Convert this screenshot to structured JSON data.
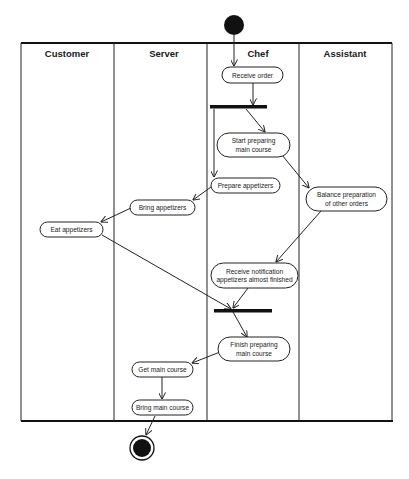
{
  "diagram": {
    "type": "uml-activity-diagram",
    "lanes": [
      {
        "id": "customer",
        "title": "Customer"
      },
      {
        "id": "server",
        "title": "Server"
      },
      {
        "id": "chef",
        "title": "Chef"
      },
      {
        "id": "assistant",
        "title": "Assistant"
      }
    ],
    "nodes": {
      "receive_order": {
        "lane": "chef",
        "lines": [
          "Receive order"
        ]
      },
      "start_main": {
        "lane": "chef",
        "lines": [
          "Start preparing",
          "main course"
        ]
      },
      "prepare_app": {
        "lane": "chef",
        "lines": [
          "Prepare appetizers"
        ]
      },
      "balance": {
        "lane": "assistant",
        "lines": [
          "Balance preparation",
          "of other orders"
        ]
      },
      "bring_app": {
        "lane": "server",
        "lines": [
          "Bring appetizers"
        ]
      },
      "eat_app": {
        "lane": "customer",
        "lines": [
          "Eat appetizers"
        ]
      },
      "receive_notif": {
        "lane": "chef",
        "lines": [
          "Receive notification",
          "appetizers almost finished"
        ]
      },
      "finish_main": {
        "lane": "chef",
        "lines": [
          "Finish preparing",
          "main course"
        ]
      },
      "get_main": {
        "lane": "server",
        "lines": [
          "Get main course"
        ]
      },
      "bring_main": {
        "lane": "server",
        "lines": [
          "Bring main course"
        ]
      }
    },
    "control_nodes": {
      "initial": {
        "type": "initial"
      },
      "fork": {
        "type": "fork-bar"
      },
      "join": {
        "type": "join-bar"
      },
      "final": {
        "type": "final"
      }
    },
    "edges": [
      {
        "from": "initial",
        "to": "receive_order"
      },
      {
        "from": "receive_order",
        "to": "fork"
      },
      {
        "from": "fork",
        "to": "start_main"
      },
      {
        "from": "fork",
        "to": "prepare_app"
      },
      {
        "from": "start_main",
        "to": "balance"
      },
      {
        "from": "prepare_app",
        "to": "bring_app"
      },
      {
        "from": "bring_app",
        "to": "eat_app"
      },
      {
        "from": "balance",
        "to": "receive_notif"
      },
      {
        "from": "eat_app",
        "to": "join"
      },
      {
        "from": "receive_notif",
        "to": "join"
      },
      {
        "from": "join",
        "to": "finish_main"
      },
      {
        "from": "finish_main",
        "to": "get_main"
      },
      {
        "from": "get_main",
        "to": "bring_main"
      },
      {
        "from": "bring_main",
        "to": "final"
      }
    ]
  }
}
